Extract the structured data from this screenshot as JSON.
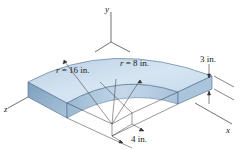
{
  "figure": {
    "type": "engineering-drawing",
    "axes": {
      "x": "x",
      "y": "y",
      "z": "z"
    },
    "dimensions": {
      "outer_radius": {
        "symbol": "r",
        "eq": "=",
        "value": "16 in."
      },
      "inner_radius": {
        "symbol": "r",
        "eq": "=",
        "value": "8 in."
      },
      "thickness": "3 in.",
      "offset": "4 in."
    },
    "colors": {
      "top_surface": "#c9dcec",
      "top_surface_light": "#e4eef7",
      "side_face": "#8fb0cc",
      "side_face_dark": "#6f93b3",
      "line": "#333333"
    }
  }
}
